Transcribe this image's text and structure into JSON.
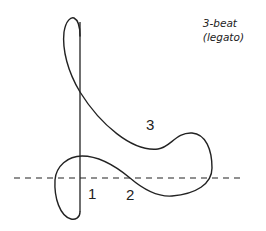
{
  "title": {
    "line1": "3-beat",
    "line2": "(legato)"
  },
  "beats": [
    {
      "label": "1"
    },
    {
      "label": "2"
    },
    {
      "label": "3"
    }
  ],
  "colors": {
    "stroke": "#222222",
    "background": "#ffffff"
  }
}
